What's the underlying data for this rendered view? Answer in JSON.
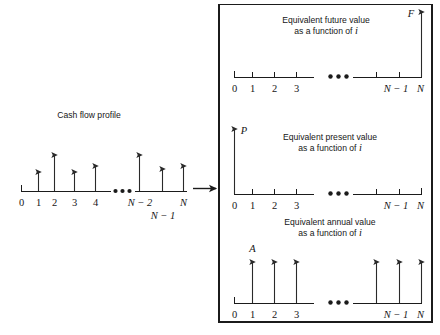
{
  "figure": {
    "background_color": "#ffffff",
    "ink_color": "#1b1b1b",
    "width": 440,
    "height": 335
  },
  "left_panel": {
    "title": "Cash flow profile",
    "axis": {
      "tick_labels": [
        "0",
        "1",
        "2",
        "3",
        "4",
        "N − 2",
        "N",
        "N − 1"
      ],
      "ellipsis": "•••"
    },
    "cash_flows": [
      {
        "period": "1",
        "relative_height": 0.52
      },
      {
        "period": "2",
        "relative_height": 1.0
      },
      {
        "period": "3",
        "relative_height": 0.52
      },
      {
        "period": "4",
        "relative_height": 0.7
      },
      {
        "period": "N − 2",
        "relative_height": 1.0
      },
      {
        "period": "N − 1",
        "relative_height": 0.62
      },
      {
        "period": "N",
        "relative_height": 0.7
      }
    ]
  },
  "connector": {
    "name": "equivalence-arrow",
    "direction": "right"
  },
  "right_box": {
    "panels": [
      {
        "id": "future-value",
        "caption_line1": "Equivalent future value",
        "caption_line2_prefix": "as a function of ",
        "caption_line2_symbol": "i",
        "symbol": "F",
        "symbol_position": "at-period-N",
        "axis": {
          "tick_labels": [
            "0",
            "1",
            "2",
            "3",
            "N − 1",
            "N"
          ],
          "ellipsis": "•••"
        },
        "arrows": [
          {
            "period": "N",
            "relative_height": 1.0
          }
        ]
      },
      {
        "id": "present-value",
        "caption_line1": "Equivalent present value",
        "caption_line2_prefix": "as a function of ",
        "caption_line2_symbol": "i",
        "symbol": "P",
        "symbol_position": "at-period-0",
        "axis": {
          "tick_labels": [
            "0",
            "1",
            "2",
            "3",
            "N − 1",
            "N"
          ],
          "ellipsis": "•••"
        },
        "arrows": [
          {
            "period": "0",
            "relative_height": 1.0
          }
        ]
      },
      {
        "id": "annual-value",
        "caption_line1": "Equivalent annual value",
        "caption_line2_prefix": "as a function of ",
        "caption_line2_symbol": "i",
        "symbol": "A",
        "symbol_position": "above-period-1",
        "axis": {
          "tick_labels": [
            "0",
            "1",
            "2",
            "3",
            "N − 1",
            "N"
          ],
          "ellipsis": "•••"
        },
        "arrows": [
          {
            "period": "1",
            "relative_height": 1.0
          },
          {
            "period": "2",
            "relative_height": 1.0
          },
          {
            "period": "3",
            "relative_height": 1.0
          },
          {
            "period": "N − 2",
            "relative_height": 1.0
          },
          {
            "period": "N − 1",
            "relative_height": 1.0
          },
          {
            "period": "N",
            "relative_height": 1.0
          }
        ]
      }
    ]
  }
}
